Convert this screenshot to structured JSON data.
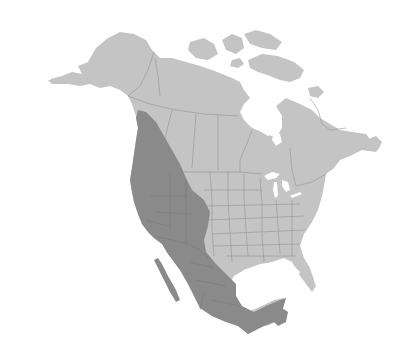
{
  "map": {
    "subject": "North America species range map",
    "regions_shown": [
      "Alaska",
      "Canada",
      "Greenland-adjacent Arctic islands",
      "United States",
      "Mexico",
      "Central America (partial)"
    ],
    "layers": [
      {
        "name": "land",
        "description": "North America base land",
        "color": "#c4c4c4"
      },
      {
        "name": "range",
        "description": "Highlighted species range: western North America from coastal British Columbia through the western United States, Great Plains edge, and nearly all of Mexico",
        "color": "#8a8a8a"
      }
    ],
    "colors": {
      "background": "#ffffff",
      "land": "#c4c4c4",
      "range": "#8a8a8a",
      "border": "#8c8c8c",
      "border_dark": "#6e6e6e"
    }
  }
}
